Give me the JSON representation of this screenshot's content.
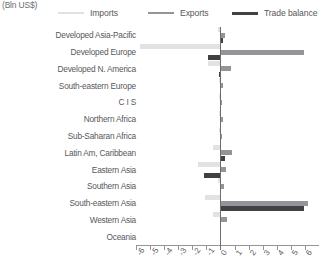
{
  "unit_label": "(Bln US$)",
  "legend": [
    {
      "name": "Imports",
      "color": "#e2e2e2"
    },
    {
      "name": "Exports",
      "color": "#939598"
    },
    {
      "name": "Trade balance",
      "color": "#414042"
    }
  ],
  "chart_data": {
    "type": "bar",
    "orientation": "horizontal",
    "title": "",
    "subtitle": "",
    "xlabel": "(Bln US$)",
    "ylabel": "",
    "xlim": [
      -6,
      7
    ],
    "xticks": [
      -6,
      -5,
      -4,
      -3,
      -2,
      -1,
      0,
      1,
      2,
      3,
      4,
      5,
      6,
      7
    ],
    "xtick_labels": [
      "-6",
      "-5",
      "-4",
      "-3",
      "-2",
      "-1",
      "0",
      "1",
      "2",
      "3",
      "4",
      "5",
      "6",
      "7"
    ],
    "grid": false,
    "legend_position": "top",
    "categories": [
      "Developed Asia-Pacific",
      "Developed Europe",
      "Developed N. America",
      "South-eastern Europe",
      "C I S",
      "Northern Africa",
      "Sub-Saharan Africa",
      "Latin Am, Caribbean",
      "Eastern Asia",
      "Southern Asia",
      "South-eastern Asia",
      "Western Asia",
      "Oceania"
    ],
    "series": [
      {
        "name": "Imports",
        "color": "#e2e2e2",
        "values": [
          -0.15,
          -5.7,
          -0.85,
          -0.1,
          -0.08,
          -0.12,
          -0.1,
          -0.5,
          -1.6,
          -0.2,
          -1.1,
          -0.55,
          -0.05
        ]
      },
      {
        "name": "Exports",
        "color": "#939598",
        "values": [
          0.35,
          5.9,
          0.75,
          0.15,
          0.1,
          0.15,
          0.12,
          0.8,
          0.4,
          0.25,
          6.2,
          0.5,
          0.05
        ]
      },
      {
        "name": "Trade balance",
        "color": "#414042",
        "values": [
          0.2,
          -0.9,
          -0.1,
          0.05,
          0.03,
          0.04,
          0.03,
          0.3,
          -1.2,
          0.06,
          5.9,
          -0.05,
          0.02
        ]
      }
    ]
  }
}
